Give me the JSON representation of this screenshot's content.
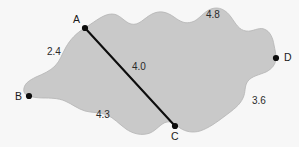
{
  "figure": {
    "type": "geometry-diagram",
    "background_color": "#f7f7f7",
    "region_fill_color": "#c9c9c9",
    "region_stroke_color": "#b4b4b4",
    "line_color": "#0d0d0d",
    "points": [
      {
        "id": "A",
        "label": "A",
        "x": 85,
        "y": 28
      },
      {
        "id": "B",
        "label": "B",
        "x": 29,
        "y": 96
      },
      {
        "id": "C",
        "label": "C",
        "x": 175,
        "y": 126
      },
      {
        "id": "D",
        "label": "D",
        "x": 276,
        "y": 58
      }
    ],
    "chord": {
      "from": "A",
      "to": "C",
      "label": "4.0"
    },
    "arc_labels": [
      {
        "id": "arc-ab",
        "label": "2.4"
      },
      {
        "id": "arc-ad",
        "label": "4.8"
      },
      {
        "id": "arc-dc",
        "label": "3.6"
      },
      {
        "id": "arc-cb",
        "label": "4.3"
      }
    ]
  }
}
